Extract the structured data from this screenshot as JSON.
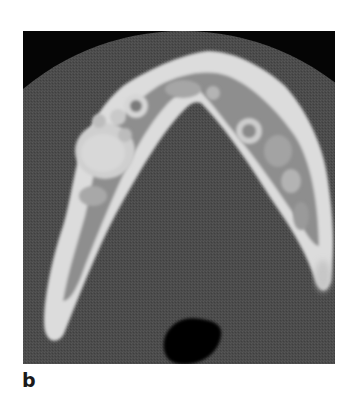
{
  "figure": {
    "panel_label": "b",
    "image": {
      "description": "Axial CT image of mandible showing multilocular lesions",
      "colors": {
        "background": "#050505",
        "field_of_view": "#4a4a4a",
        "bone_cortex": "#e4e4e4",
        "bone_medulla": "#9a9a9a",
        "lesion": "#c8c8c8",
        "air": "#000000"
      }
    }
  }
}
